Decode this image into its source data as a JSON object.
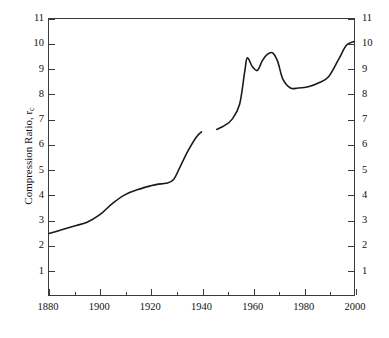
{
  "chart_data": {
    "type": "line",
    "title": "",
    "xlabel": "",
    "ylabel": "Compression Ratio, r",
    "ylabel_sub": "c",
    "xlim": [
      1880,
      2000
    ],
    "ylim": [
      0,
      11
    ],
    "grid": false,
    "legend": null,
    "x_major_ticks": [
      1880,
      1900,
      1920,
      1940,
      1960,
      1980,
      2000
    ],
    "x_minor_ticks": [
      1890,
      1910,
      1930,
      1950,
      1970,
      1990
    ],
    "y_major_ticks": [
      1,
      2,
      3,
      4,
      5,
      6,
      7,
      8,
      9,
      10,
      11
    ],
    "x_tick_labels": [
      "1880",
      "1900",
      "1920",
      "1940",
      "1960",
      "1980",
      "2000"
    ],
    "y_tick_labels": [
      "1",
      "2",
      "3",
      "4",
      "5",
      "6",
      "7",
      "8",
      "9",
      "10",
      "11"
    ],
    "y_tick_labels_right": [
      "1",
      "2",
      "3",
      "4",
      "5",
      "6",
      "7",
      "8",
      "9",
      "10",
      "11"
    ],
    "line_color": "#1a1a1a",
    "line_width": 1.6,
    "series": [
      {
        "name": "Compression ratio (pre-war)",
        "x": [
          1880,
          1885,
          1890,
          1895,
          1900,
          1905,
          1910,
          1915,
          1920,
          1923,
          1926,
          1929,
          1932,
          1935,
          1938,
          1940
        ],
        "values": [
          2.45,
          2.6,
          2.75,
          2.9,
          3.2,
          3.65,
          4.0,
          4.2,
          4.35,
          4.42,
          4.45,
          4.6,
          5.2,
          5.8,
          6.3,
          6.5
        ]
      },
      {
        "name": "Compression ratio (post-war)",
        "x": [
          1946,
          1949,
          1952,
          1955,
          1957,
          1958,
          1960,
          1962,
          1964,
          1966,
          1968,
          1970,
          1972,
          1975,
          1978,
          1982,
          1986,
          1990,
          1994,
          1997,
          2000
        ],
        "values": [
          6.6,
          6.75,
          7.0,
          7.6,
          8.9,
          9.45,
          9.1,
          8.95,
          9.35,
          9.6,
          9.65,
          9.3,
          8.6,
          8.25,
          8.25,
          8.3,
          8.45,
          8.7,
          9.4,
          9.95,
          10.1
        ]
      }
    ]
  }
}
